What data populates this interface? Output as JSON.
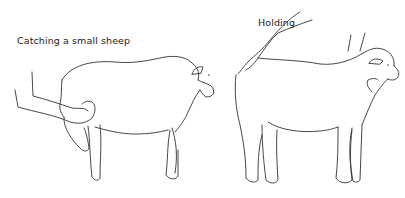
{
  "illustration": {
    "panels": [
      {
        "caption": "Catching a small sheep",
        "subject": "person's arm holding sheep's front leg up"
      },
      {
        "caption": "Holding",
        "subject": "hands at sheep's rump and under chin"
      }
    ],
    "colors": {
      "line": "#333333",
      "background": "#ffffff"
    }
  }
}
